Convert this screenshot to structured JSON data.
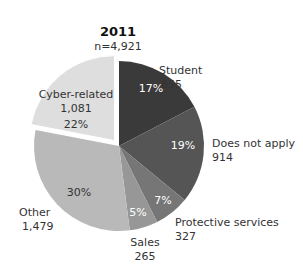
{
  "chart_data": {
    "type": "pie",
    "title": "2011",
    "subtitle": "n=4,921",
    "total": 4921,
    "slices": [
      {
        "label": "Student",
        "value": 855,
        "percent_label": "17%",
        "value_label": "855",
        "color": "#3a3a3a",
        "exploded": false
      },
      {
        "label": "Does not apply",
        "value": 914,
        "percent_label": "19%",
        "value_label": "914",
        "color": "#555555",
        "exploded": false
      },
      {
        "label": "Protective services",
        "value": 327,
        "percent_label": "7%",
        "value_label": "327",
        "color": "#767676",
        "exploded": false
      },
      {
        "label": "Sales",
        "value": 265,
        "percent_label": "5%",
        "value_label": "265",
        "color": "#979797",
        "exploded": false
      },
      {
        "label": "Other",
        "value": 1479,
        "percent_label": "30%",
        "value_label": "1,479",
        "color": "#b9b9b9",
        "exploded": false
      },
      {
        "label": "Cyber-related",
        "value": 1081,
        "percent_label": "22%",
        "value_label": "1,081",
        "color": "#dedede",
        "exploded": true
      }
    ],
    "start_angle": "12 o'clock",
    "direction": "clockwise",
    "legend": "none (direct labels)"
  },
  "labels": {
    "title": "2011",
    "subtitle": "n=4,921",
    "student_name": "Student",
    "student_value": "855",
    "student_pct": "17%",
    "dna_name": "Does not apply",
    "dna_value": "914",
    "dna_pct": "19%",
    "prot_name": "Protective services",
    "prot_value": "327",
    "prot_pct": "7%",
    "sales_name": "Sales",
    "sales_value": "265",
    "sales_pct": "5%",
    "other_name": "Other",
    "other_value": "1,479",
    "other_pct": "30%",
    "cyber_name": "Cyber-related",
    "cyber_value": "1,081",
    "cyber_pct": "22%"
  }
}
